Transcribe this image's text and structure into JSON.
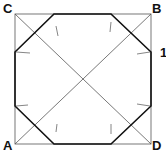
{
  "diagram": {
    "labels": {
      "top_left": "C",
      "top_right": "B",
      "bottom_left": "A",
      "bottom_right": "D",
      "side_marker": "1"
    },
    "square": {
      "x": 15,
      "y": 14,
      "size": 136
    },
    "colors": {
      "thin_line": "#555555",
      "thick_line": "#111111",
      "background": "#ffffff"
    }
  }
}
